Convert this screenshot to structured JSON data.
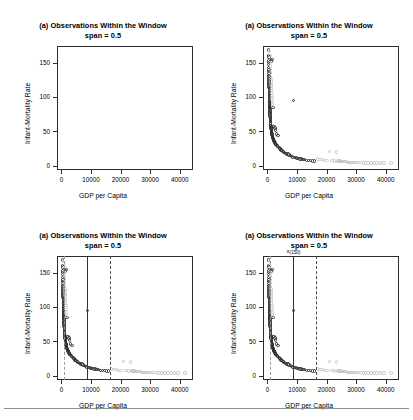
{
  "figure": {
    "width": 413,
    "height": 420,
    "layout": "2x2 grid of scatterplots",
    "separator_rule": true
  },
  "common": {
    "title_line1": "(a) Observations Within the Window",
    "title_line2": "span = 0.5",
    "xlabel": "GDP per Capita",
    "ylabel": "Infant-Mortality Rate",
    "xticks": [
      0,
      10000,
      20000,
      30000,
      40000
    ],
    "xtick_labels": [
      "0",
      "10000",
      "20000",
      "30000",
      "40000"
    ],
    "yticks": [
      0,
      50,
      100,
      150
    ],
    "ytick_labels": [
      "0",
      "50",
      "100",
      "150"
    ],
    "xlim": [
      -1500,
      44500
    ],
    "ylim": [
      -6,
      174
    ],
    "point_color": "#2f2f2f",
    "point_color_outside": "#c3c3c3",
    "frame_color": "#2d2d2d",
    "marker": "open-circle"
  },
  "annotations": {
    "order_statistic_label": "x",
    "order_statistic_sub": "(150)"
  },
  "chart_data": {
    "type": "scatter",
    "title": "(a) Observations Within the Window",
    "subtitle": "span = 0.5",
    "xlabel": "GDP per Capita",
    "ylabel": "Infant-Mortality Rate",
    "xlim": [
      -1500,
      44500
    ],
    "ylim": [
      -6,
      174
    ],
    "xticks": [
      0,
      10000,
      20000,
      30000,
      40000
    ],
    "yticks": [
      0,
      50,
      100,
      150
    ],
    "grid": false,
    "legend": null,
    "panels": [
      {
        "index": 0,
        "position": "top-left",
        "points_shown": false,
        "window_lines": [],
        "annotation": null
      },
      {
        "index": 1,
        "position": "top-right",
        "points_shown": true,
        "window_lines": [],
        "annotation": null
      },
      {
        "index": 2,
        "position": "bottom-left",
        "points_shown": true,
        "window_lines": [
          {
            "x": 900,
            "style": "dashed",
            "weight": "faint"
          },
          {
            "x": 8800,
            "style": "solid",
            "weight": "normal"
          },
          {
            "x": 16500,
            "style": "dashed",
            "weight": "normal"
          }
        ],
        "annotation": null
      },
      {
        "index": 3,
        "position": "bottom-right",
        "points_shown": true,
        "window_lines": [
          {
            "x": 900,
            "style": "dashed",
            "weight": "faint"
          },
          {
            "x": 8800,
            "style": "solid",
            "weight": "normal"
          },
          {
            "x": 16500,
            "style": "dashed",
            "weight": "normal"
          }
        ],
        "annotation": {
          "x": 8800,
          "text": "x(150)"
        }
      }
    ],
    "window_boundary_solid": 8800,
    "window_boundary_dashed": 16500,
    "window_boundary_left": 900,
    "series": [
      {
        "name": "inside-window",
        "color": "#2f2f2f",
        "x": [
          360,
          400,
          410,
          430,
          450,
          460,
          470,
          480,
          490,
          500,
          510,
          520,
          530,
          540,
          550,
          560,
          570,
          580,
          590,
          600,
          610,
          620,
          630,
          640,
          650,
          660,
          670,
          680,
          690,
          700,
          710,
          720,
          730,
          740,
          750,
          760,
          770,
          780,
          790,
          800,
          820,
          840,
          860,
          880,
          900,
          920,
          940,
          960,
          980,
          1000,
          1030,
          1060,
          1090,
          1120,
          1150,
          1180,
          1210,
          1240,
          1270,
          1300,
          1340,
          1380,
          1420,
          1460,
          1500,
          1550,
          1600,
          1650,
          1700,
          1750,
          1800,
          1850,
          1900,
          1950,
          2000,
          2080,
          2160,
          2240,
          2320,
          2400,
          2500,
          2600,
          2700,
          2800,
          2900,
          3000,
          3150,
          3300,
          3450,
          3600,
          3800,
          4000,
          4200,
          4400,
          4600,
          4900,
          5200,
          5500,
          5800,
          6100,
          6500,
          6900,
          7300,
          7700,
          8100,
          8500,
          8800,
          9200,
          9600,
          10000,
          10500,
          11000,
          11500,
          12000,
          12600,
          13200,
          13800,
          14500,
          15200,
          16000
        ],
        "y": [
          168,
          152,
          150,
          147,
          160,
          143,
          139,
          137,
          158,
          134,
          131,
          129,
          126,
          124,
          122,
          120,
          118,
          116,
          114,
          112,
          110,
          108,
          106,
          105,
          103,
          101,
          100,
          98,
          97,
          95,
          94,
          92,
          91,
          90,
          88,
          87,
          86,
          85,
          84,
          83,
          81,
          79,
          77,
          76,
          74,
          72,
          70,
          69,
          67,
          66,
          64,
          62,
          61,
          59,
          58,
          56,
          55,
          54,
          52,
          51,
          50,
          49,
          48,
          152,
          46,
          45,
          154,
          44,
          43,
          42,
          41,
          85,
          40,
          39,
          38,
          37,
          36,
          57,
          35,
          34,
          55,
          33,
          32,
          52,
          31,
          30,
          46,
          29,
          28,
          44,
          27,
          26,
          25,
          24,
          23,
          22,
          21,
          20,
          19,
          18,
          17,
          17,
          16,
          15,
          14,
          13,
          95,
          12,
          12,
          11,
          11,
          10,
          10,
          9,
          9,
          8,
          8,
          8,
          7,
          7
        ]
      },
      {
        "name": "outside-window",
        "color": "#c3c3c3",
        "x": [
          17000,
          17800,
          18600,
          19400,
          20200,
          21000,
          21800,
          22600,
          23400,
          23800,
          24200,
          24600,
          25000,
          25400,
          25800,
          26200,
          26600,
          27000,
          27600,
          28200,
          28800,
          29400,
          30000,
          30800,
          31600,
          32400,
          33200,
          34000,
          35000,
          36000,
          37000,
          38200,
          39400,
          41800,
          700,
          800,
          900,
          950,
          1000,
          1050,
          1100,
          1150,
          1200,
          1250,
          1300,
          1350,
          1400,
          1450,
          1500,
          1550,
          1600,
          1650,
          1700,
          1750
        ],
        "y": [
          10,
          9,
          9,
          8,
          8,
          21,
          8,
          7,
          20,
          7,
          7,
          7,
          6,
          6,
          6,
          6,
          6,
          5,
          5,
          5,
          5,
          5,
          5,
          5,
          5,
          4,
          4,
          4,
          4,
          4,
          4,
          4,
          4,
          4,
          166,
          160,
          150,
          145,
          140,
          135,
          130,
          127,
          123,
          119,
          116,
          112,
          109,
          106,
          102,
          99,
          96,
          92,
          89,
          86
        ]
      }
    ]
  }
}
